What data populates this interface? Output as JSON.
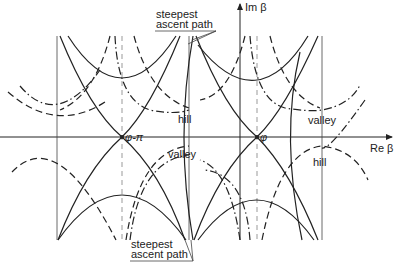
{
  "figure": {
    "axes": {
      "x_label": "Re β",
      "y_label": "Im β"
    },
    "saddle_points": [
      {
        "label": "φ-π"
      },
      {
        "label": "φ"
      }
    ],
    "regions": {
      "hill_1": "hill",
      "valley_1": "valley",
      "valley_2": "valley",
      "hill_2": "hill"
    },
    "annotations": {
      "top": {
        "line1": "steepest",
        "line2": "ascent  path"
      },
      "bottom": {
        "line1": "steepest",
        "line2": "ascent  path"
      }
    },
    "colors": {
      "ink": "#222222",
      "guide": "#999999",
      "background": "#ffffff"
    }
  }
}
